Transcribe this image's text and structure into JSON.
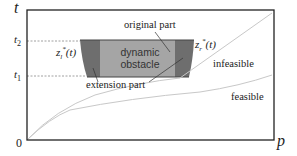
{
  "axes": {
    "y_label": "t",
    "x_label": "p",
    "origin_label": "0",
    "ticks": [
      {
        "name": "t2",
        "label": "t",
        "sub": "2"
      },
      {
        "name": "t1",
        "label": "t",
        "sub": "1"
      }
    ]
  },
  "obstacle": {
    "line1": "dynamic",
    "line2": "obstacle",
    "colors": {
      "original": "#a5a5a5",
      "extension": "#6e6e6e",
      "frame": "#222222",
      "curve": "#c8c8c8",
      "dashed": "#888888"
    }
  },
  "labels": {
    "original_part": "original part",
    "extension_part": "extension part",
    "infeasible": "infeasible",
    "feasible": "feasible",
    "z_left": {
      "base": "z",
      "sub": "l",
      "sup": "*",
      "arg": "(t)"
    },
    "z_right": {
      "base": "z",
      "sub": "r",
      "sup": "*",
      "arg": "(t)"
    }
  }
}
